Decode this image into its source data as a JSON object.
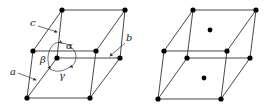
{
  "figures": [
    {
      "name": "unit-cell-with-parameters",
      "labels": {
        "a": "a",
        "b": "b",
        "c": "c",
        "alpha": "α",
        "beta": "β",
        "gamma": "γ"
      }
    },
    {
      "name": "base-centered-cell",
      "face_centers": [
        "top",
        "bottom"
      ]
    }
  ],
  "colors": {
    "stroke": "#333333",
    "atom": "#000000"
  }
}
